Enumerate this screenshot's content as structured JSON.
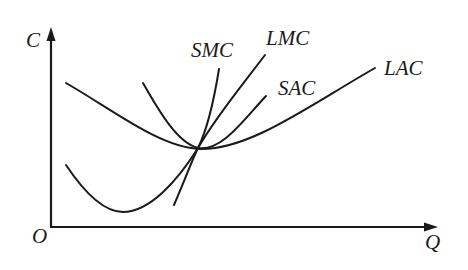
{
  "diagram": {
    "title": "",
    "type": "cost-curves",
    "axes": {
      "y_label": "C",
      "x_label": "Q",
      "origin_label": "O"
    },
    "curves": [
      {
        "id": "smc",
        "label": "SMC"
      },
      {
        "id": "lmc",
        "label": "LMC"
      },
      {
        "id": "sac",
        "label": "SAC"
      },
      {
        "id": "lac",
        "label": "LAC"
      }
    ],
    "colors": {
      "stroke": "#1a1a1a",
      "background": "#ffffff"
    }
  }
}
